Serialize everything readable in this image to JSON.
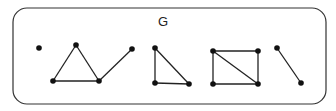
{
  "graph": {
    "label": "G",
    "frame": {
      "x": 13,
      "y": 8,
      "w": 313,
      "h": 96,
      "r": 14
    },
    "nodes": [
      {
        "id": "a",
        "x": 39,
        "y": 48
      },
      {
        "id": "b",
        "x": 76,
        "y": 45
      },
      {
        "id": "c",
        "x": 53,
        "y": 81
      },
      {
        "id": "d",
        "x": 99,
        "y": 81
      },
      {
        "id": "e",
        "x": 132,
        "y": 49
      },
      {
        "id": "f",
        "x": 155,
        "y": 48
      },
      {
        "id": "g",
        "x": 155,
        "y": 83
      },
      {
        "id": "h",
        "x": 189,
        "y": 84
      },
      {
        "id": "i",
        "x": 213,
        "y": 51
      },
      {
        "id": "j",
        "x": 258,
        "y": 51
      },
      {
        "id": "k",
        "x": 213,
        "y": 84
      },
      {
        "id": "l",
        "x": 258,
        "y": 84
      },
      {
        "id": "m",
        "x": 277,
        "y": 48
      },
      {
        "id": "n",
        "x": 301,
        "y": 83
      }
    ],
    "edges": [
      [
        "b",
        "c"
      ],
      [
        "b",
        "d"
      ],
      [
        "c",
        "d"
      ],
      [
        "d",
        "e"
      ],
      [
        "f",
        "g"
      ],
      [
        "f",
        "h"
      ],
      [
        "g",
        "h"
      ],
      [
        "i",
        "j"
      ],
      [
        "i",
        "k"
      ],
      [
        "j",
        "l"
      ],
      [
        "k",
        "l"
      ],
      [
        "i",
        "l"
      ],
      [
        "m",
        "n"
      ]
    ]
  }
}
